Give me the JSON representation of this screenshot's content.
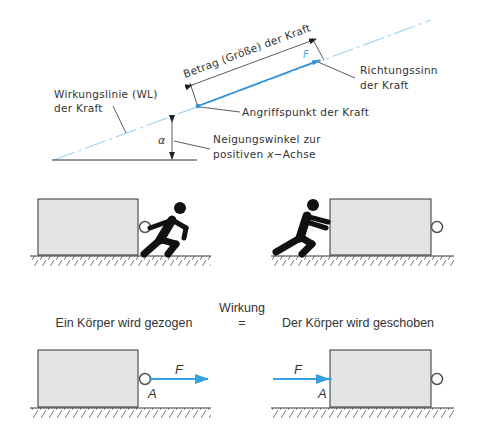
{
  "top_diagram": {
    "labels": {
      "magnitude": "Betrag (Größe) der Kraft",
      "force_symbol": "F",
      "direction_line1": "Richtungssinn",
      "direction_line2": "der Kraft",
      "line_of_action_line1": "Wirkungslinie (WL)",
      "line_of_action_line2": "der Kraft",
      "point_of_application": "Angriffspunkt der Kraft",
      "angle_symbol": "α",
      "angle_line1": "Neigungswinkel zur",
      "angle_line2_prefix": "positiven ",
      "angle_line2_var": "x",
      "angle_line2_suffix": "−Achse"
    },
    "colors": {
      "force_vector": "#2f8fd8",
      "line_of_action": "#9fd3ee",
      "annotation": "#333333"
    }
  },
  "middle_diagram": {
    "left_scene": "person pulling box",
    "right_scene": "person pushing box"
  },
  "bottom_diagram": {
    "center_label_top": "Wirkung",
    "center_label_equals": "=",
    "left_caption": "Ein Körper wird gezogen",
    "right_caption": "Der Körper wird geschoben",
    "left_force_symbol": "F",
    "left_point_symbol": "A",
    "right_force_symbol": "F",
    "right_point_symbol": "A",
    "colors": {
      "box_fill": "#e2e4e5",
      "arrow": "#36a0dc"
    }
  }
}
